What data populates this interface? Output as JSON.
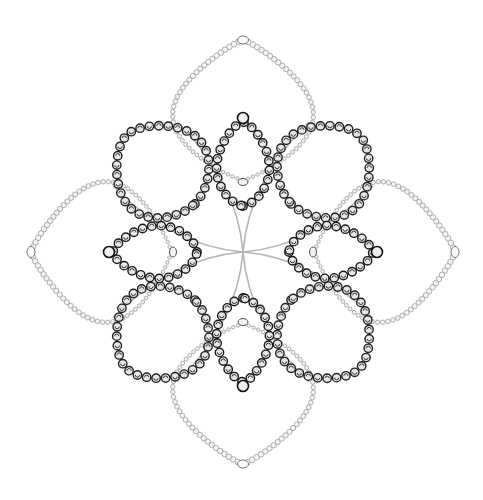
{
  "figure": {
    "width": 483,
    "height": 500,
    "background": "#ffffff",
    "center": [
      243,
      252
    ],
    "outer_petals": {
      "count": 4,
      "angles_deg": [
        0,
        90,
        180,
        270
      ],
      "tip_distance": 212,
      "base_distance": 12,
      "half_width": 80,
      "bead_color": "#9a9a9a",
      "bead_fill": "#f4f4f4",
      "bead_radius": 2.6,
      "bead_spacing": 5.2,
      "tip_bead": {
        "rx": 5.5,
        "ry": 4
      }
    },
    "diagonal_petals": {
      "count": 4,
      "angles_deg": [
        45,
        135,
        225,
        315
      ],
      "inner_distance": 28,
      "outer_distance": 165,
      "half_width": 55,
      "scroll_color": "#222222",
      "scroll_fill": "#e6e6e6",
      "scroll_radius": 4.2,
      "scroll_spacing": 9.5
    },
    "inner_lobes": {
      "count": 4,
      "angles_deg": [
        0,
        90,
        180,
        270
      ],
      "inner_distance": 26,
      "outer_distance": 130,
      "half_width": 30,
      "scroll_color": "#1a1a1a",
      "scroll_fill": "#e8e8e8",
      "scroll_radius": 4.2,
      "scroll_spacing": 9.5,
      "tip_ring_radius": 5.5,
      "bottom_oval": {
        "rx": 5,
        "ry": 3.5,
        "distance": 70
      }
    },
    "center_cross": {
      "color": "#b5b5b5",
      "arm_length": 130,
      "curve_offset": 30
    }
  }
}
